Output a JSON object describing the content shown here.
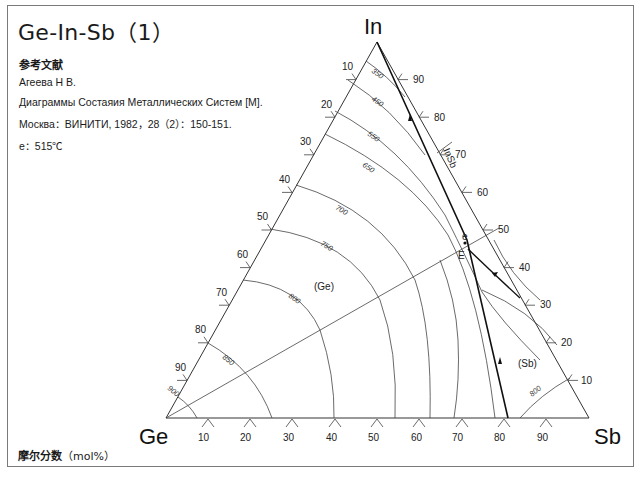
{
  "title": "Ge-In-Sb（1）",
  "reference": {
    "heading": "参考文献",
    "lines": [
      "Агеева Н В.",
      "Диаграммы Состаяия Металлических Систем [M].",
      "Москва：ВИНИТИ, 1982，28（2）：150-151."
    ]
  },
  "note": "e：515℃",
  "footer": {
    "label": "摩尔分数",
    "unit": "（mol%）"
  },
  "diagram": {
    "type": "ternary-liquidus-projection",
    "vertices": {
      "left": "Ge",
      "top": "In",
      "right": "Sb"
    },
    "axis_ticks": {
      "left_edge_In": [
        "10",
        "20",
        "30",
        "40",
        "50",
        "60",
        "70",
        "80",
        "90"
      ],
      "right_edge_In": [
        "90",
        "80",
        "70",
        "60",
        "50",
        "40",
        "30",
        "20",
        "10"
      ],
      "bottom_edge_Sb": [
        "10",
        "20",
        "30",
        "40",
        "50",
        "60",
        "70",
        "80",
        "90"
      ]
    },
    "isotherms_C": [
      "350",
      "450",
      "550",
      "650",
      "700",
      "750",
      "800",
      "850",
      "900"
    ],
    "isotherm_right": "800",
    "regions": [
      "(Ge)",
      "(Sb)"
    ],
    "compound_line": "InSb",
    "points": {
      "eutectic_binary": "e",
      "eutectic_ternary": "E"
    },
    "e_temperature": "515℃"
  }
}
